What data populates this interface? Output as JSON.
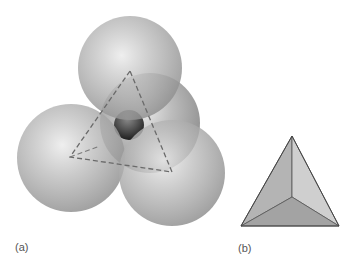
{
  "panels": [
    {
      "id": "a",
      "label": "(a)",
      "description": "Four close-packed spheres forming a tetrahedral void, with dashed triangle connecting sphere centers",
      "spheres": [
        {
          "name": "back",
          "cx": 150,
          "cy": 123,
          "r": 50
        },
        {
          "name": "top",
          "cx": 130,
          "cy": 68,
          "r": 52
        },
        {
          "name": "left",
          "cx": 71,
          "cy": 158,
          "r": 54
        },
        {
          "name": "front-right",
          "cx": 172,
          "cy": 173,
          "r": 53
        }
      ],
      "void_sphere": {
        "cx": 129,
        "cy": 125,
        "r": 15
      },
      "dashed_triangle": {
        "top": [
          130,
          71
        ],
        "left": [
          70,
          157
        ],
        "right": [
          172,
          172
        ]
      },
      "hidden_edge": {
        "from": [
          70,
          157
        ],
        "to": [
          100,
          146
        ]
      }
    },
    {
      "id": "b",
      "label": "(b)",
      "description": "Solid tetrahedron viewed from above",
      "tetrahedron": {
        "apex": [
          292,
          136
        ],
        "bottom_left": [
          241,
          226
        ],
        "bottom_right": [
          339,
          226
        ],
        "center": [
          292,
          197
        ]
      },
      "face_colors": {
        "left": "#b4b4b4",
        "right": "#cfcfcf",
        "bottom": "#a3a3a3"
      }
    }
  ],
  "colors": {
    "sphere_base": "#9c9c9c",
    "sphere_highlight": "#eeeeee",
    "dash": "#6a6a6a",
    "edge": "#555555"
  }
}
